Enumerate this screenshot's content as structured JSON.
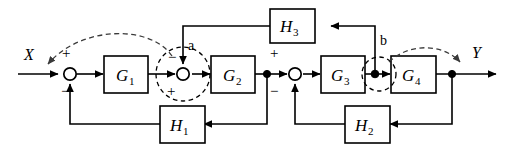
{
  "diagram": {
    "kind": "control-system-block-diagram",
    "input_label": "X",
    "output_label": "Y",
    "blocks": [
      {
        "id": "G1",
        "label": "G",
        "subscript": "1"
      },
      {
        "id": "G2",
        "label": "G",
        "subscript": "2"
      },
      {
        "id": "G3",
        "label": "G",
        "subscript": "3"
      },
      {
        "id": "G4",
        "label": "G",
        "subscript": "4"
      },
      {
        "id": "H1",
        "label": "H",
        "subscript": "1"
      },
      {
        "id": "H2",
        "label": "H",
        "subscript": "2"
      },
      {
        "id": "H3",
        "label": "H",
        "subscript": "3"
      }
    ],
    "node_labels": {
      "a": "a",
      "b": "b"
    },
    "summing_signs": {
      "sum1_top": "+",
      "sum1_bottom": "−",
      "sum_a_top": "−",
      "sum_a_bottom": "+",
      "sum3_top": "+",
      "sum3_bottom": "−"
    },
    "colors": {
      "line": "#000000",
      "background": "#ffffff",
      "dashed_annotation": "#3a3a3a"
    }
  }
}
